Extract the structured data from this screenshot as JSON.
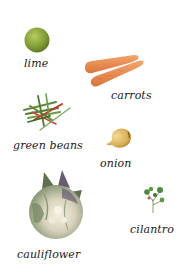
{
  "items": [
    {
      "name": "lime",
      "label": "lime",
      "icon": "lime-icon",
      "color": "#8aa63a"
    },
    {
      "name": "carrots",
      "label": "carrots",
      "icon": "carrots-icon",
      "color": "#e8884a"
    },
    {
      "name": "green-beans",
      "label": "green beans",
      "icon": "green-beans-icon",
      "color": "#5b8a3a",
      "accent": "#c0392b"
    },
    {
      "name": "onion",
      "label": "onion",
      "icon": "onion-icon",
      "color": "#e0b860"
    },
    {
      "name": "cauliflower",
      "label": "cauliflower",
      "icon": "cauliflower-icon",
      "color": "#7a8a6a",
      "accent": "#f0ead8"
    },
    {
      "name": "cilantro",
      "label": "cilantro",
      "icon": "cilantro-icon",
      "color": "#4f8a3a"
    }
  ]
}
